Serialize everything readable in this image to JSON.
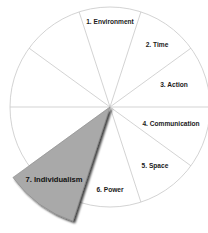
{
  "diagram": {
    "type": "segmented-wheel",
    "center": [
      110,
      107
    ],
    "radius": 100,
    "highlight_radius": 120,
    "segment_count": 10,
    "colors": {
      "background": "#ffffff",
      "divider": "#c8c8c8",
      "highlight_fill": "#a9a9a9",
      "highlight_shadow": "#222222",
      "label": "#1a1a1a"
    },
    "segments": [
      {
        "label": "1. Environment",
        "highlighted": false
      },
      {
        "label": "2. Time",
        "highlighted": false
      },
      {
        "label": "3. Action",
        "highlighted": false
      },
      {
        "label": "4. Communication",
        "highlighted": false
      },
      {
        "label": "5. Space",
        "highlighted": false
      },
      {
        "label": "6. Power",
        "highlighted": false
      },
      {
        "label": "7. Individualism",
        "highlighted": true
      },
      {
        "label": "",
        "highlighted": false
      },
      {
        "label": "",
        "highlighted": false
      },
      {
        "label": "",
        "highlighted": false
      }
    ]
  }
}
